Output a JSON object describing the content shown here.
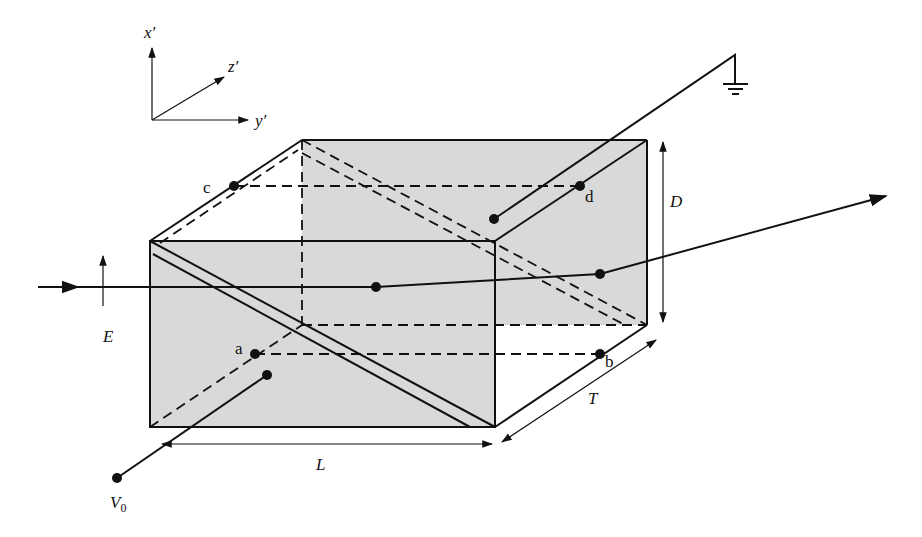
{
  "axes": {
    "x_label": "x′",
    "y_label": "y′",
    "z_label": "z′"
  },
  "labels": {
    "E": "E",
    "D": "D",
    "L": "L",
    "T": "T",
    "V0": "V",
    "V0_sub": "0",
    "a": "a",
    "b": "b",
    "c": "c",
    "d": "d"
  },
  "elements": {
    "input_beam": "incident light beam with polarization E",
    "output_beam": "transmitted beam exiting to the right",
    "ground": "ground-symbol",
    "voltage_terminal": "V0 terminal"
  },
  "colors": {
    "line": "#111111",
    "shade": "#d9d9d9",
    "background": "#ffffff"
  }
}
